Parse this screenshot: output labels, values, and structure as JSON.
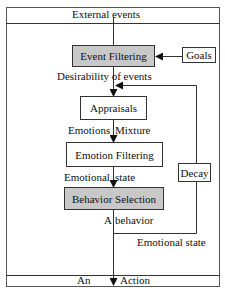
{
  "diagram": {
    "header_label": "External events",
    "footer_labels": {
      "left": "An",
      "right": "Action"
    },
    "nodes": {
      "event_filtering": "Event Filtering",
      "goals": "Goals",
      "appraisals": "Appraisals",
      "emotion_filtering": "Emotion Filtering",
      "behavior_selection": "Behavior Selection",
      "decay": "Decay"
    },
    "edge_labels": {
      "desirability": "Desirability of  events",
      "emotions_mixture_left": "Emotions",
      "emotions_mixture_right": "Mixture",
      "emotional_state_left": "Emotional",
      "emotional_state_right": "state",
      "a_behavior_left": "A",
      "a_behavior_right": "behavior",
      "feedback_emotional_state": "Emotional state"
    },
    "colors": {
      "shaded_box": "#c8c8c8",
      "line": "#333333",
      "background": "#ffffff"
    }
  }
}
